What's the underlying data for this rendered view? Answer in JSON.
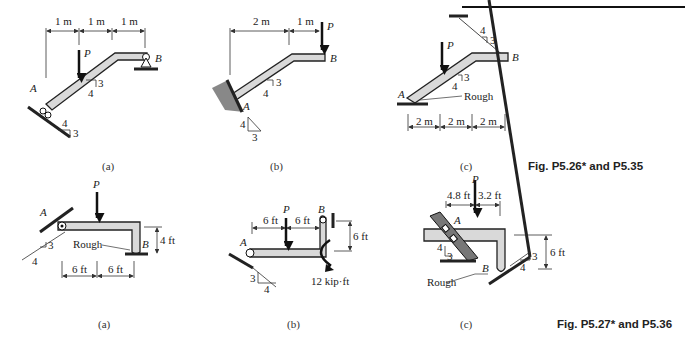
{
  "top_rule": true,
  "figure_groups": [
    {
      "caption": "Fig. P5.26* and P5.35",
      "panels": [
        {
          "id": "a",
          "label": "(a)",
          "dims": [
            "1 m",
            "1 m",
            "1 m"
          ],
          "load": "P",
          "points": [
            "A",
            "B"
          ],
          "slope_beam": [
            "3",
            "4"
          ],
          "slope_ground": [
            "4",
            "3"
          ]
        },
        {
          "id": "b",
          "label": "(b)",
          "dims": [
            "2 m",
            "1 m"
          ],
          "load": "P",
          "points": [
            "A",
            "B"
          ],
          "slope_beam": [
            "3",
            "4"
          ],
          "slope_ground": [
            "4",
            "3"
          ]
        },
        {
          "id": "c",
          "label": "(c)",
          "dims": [
            "2 m",
            "2 m",
            "2 m"
          ],
          "load": "P",
          "points": [
            "A",
            "B"
          ],
          "slope_beam": [
            "3",
            "4"
          ],
          "slope_cable": [
            "4",
            "3"
          ],
          "note": "Rough"
        }
      ]
    },
    {
      "caption": "Fig. P5.27* and P5.36",
      "panels": [
        {
          "id": "a",
          "label": "(a)",
          "dims": [
            "6 ft",
            "6 ft",
            "4 ft"
          ],
          "load": "P",
          "points": [
            "A",
            "B"
          ],
          "slope": [
            "3",
            "4"
          ],
          "note": "Rough"
        },
        {
          "id": "b",
          "label": "(b)",
          "dims": [
            "6 ft",
            "6 ft",
            "6 ft"
          ],
          "load": "P",
          "moment": "12 kip·ft",
          "points": [
            "A",
            "B"
          ],
          "slope": [
            "3",
            "4"
          ]
        },
        {
          "id": "c",
          "label": "(c)",
          "dims": [
            "4.8 ft",
            "3.2 ft",
            "6 ft"
          ],
          "load": "P",
          "points": [
            "A",
            "B"
          ],
          "slope_left": [
            "4",
            "3"
          ],
          "slope_right": [
            "3",
            "4"
          ],
          "note": "Rough"
        }
      ]
    }
  ]
}
